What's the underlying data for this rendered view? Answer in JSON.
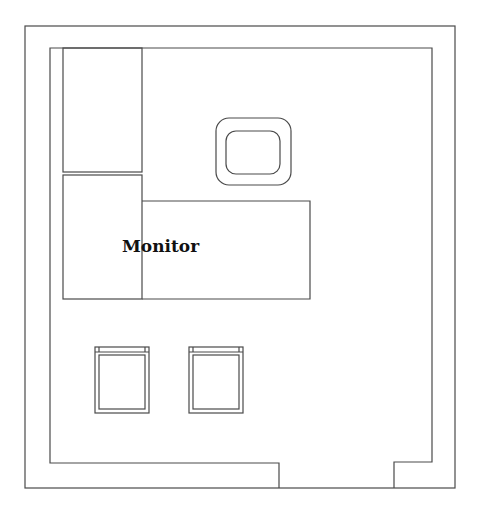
{
  "diagram": {
    "type": "floor-plan",
    "rooms": [
      {
        "name": "room",
        "furniture": [
          {
            "id": "cabinet-upper",
            "kind": "cabinet"
          },
          {
            "id": "cabinet-lower",
            "kind": "cabinet"
          },
          {
            "id": "desk",
            "kind": "desk",
            "label": "Monitor"
          },
          {
            "id": "monitor",
            "kind": "monitor"
          },
          {
            "id": "chair-left",
            "kind": "chair"
          },
          {
            "id": "chair-right",
            "kind": "chair"
          }
        ]
      }
    ],
    "labels": {
      "desk_label": "Monitor"
    },
    "colors": {
      "line": "#4a4a4a",
      "background": "#ffffff",
      "text": "#111111"
    }
  }
}
